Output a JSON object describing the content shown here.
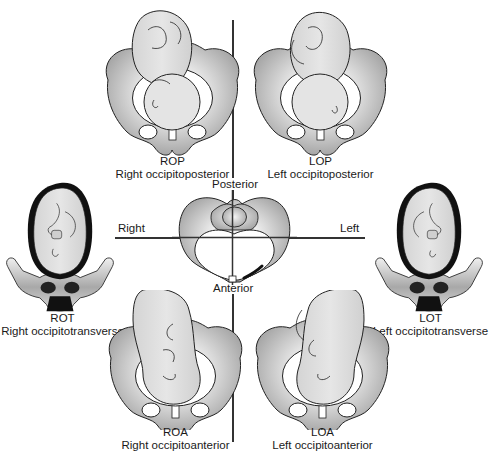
{
  "diagram": {
    "type": "fetal-position-diagram",
    "axes": {
      "posterior": "Posterior",
      "anterior": "Anterior",
      "right": "Right",
      "left": "Left"
    },
    "positions": [
      {
        "abbr": "ROP",
        "name": "Right occipitoposterior"
      },
      {
        "abbr": "LOP",
        "name": "Left occipitoposterior"
      },
      {
        "abbr": "ROT",
        "name": "Right occipitotransverse"
      },
      {
        "abbr": "LOT",
        "name": "Left occipitotransverse"
      },
      {
        "abbr": "ROA",
        "name": "Right occipitoanterior"
      },
      {
        "abbr": "LOA",
        "name": "Left occipitoanterior"
      }
    ],
    "colors": {
      "line": "#333333",
      "pelvis_light": "#e8e8e8",
      "pelvis_dark": "#9a9a9a",
      "fetus": "#dcdcdc",
      "outline": "#222222",
      "uterus_wall": "#111111"
    }
  }
}
